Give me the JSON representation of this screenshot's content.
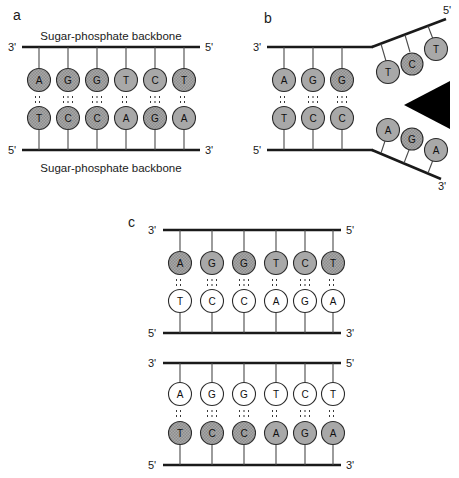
{
  "figure": {
    "panels": [
      {
        "id": "a",
        "label": "a",
        "top_strand": {
          "left_end": "3'",
          "right_end": "5'",
          "backbone_label": "Sugar-phosphate backbone",
          "bases": [
            "A",
            "G",
            "G",
            "T",
            "C",
            "T"
          ],
          "base_fill": "shaded"
        },
        "bottom_strand": {
          "left_end": "5'",
          "right_end": "3'",
          "backbone_label": "Sugar-phosphate backbone",
          "bases": [
            "T",
            "C",
            "C",
            "A",
            "G",
            "A"
          ],
          "base_fill": "shaded"
        },
        "hydrogen_bonds": [
          2,
          3,
          3,
          2,
          3,
          2
        ]
      },
      {
        "id": "b",
        "label": "b",
        "paired_region": {
          "top_bases": [
            "A",
            "G",
            "G"
          ],
          "bottom_bases": [
            "T",
            "C",
            "C"
          ],
          "hydrogen_bonds": [
            2,
            3,
            3
          ]
        },
        "top_strand": {
          "left_end": "3'",
          "fork_end": "5'",
          "unpaired_bases": [
            "T",
            "C",
            "T"
          ]
        },
        "bottom_strand": {
          "left_end": "5'",
          "fork_end": "3'",
          "unpaired_bases": [
            "A",
            "G",
            "A"
          ]
        },
        "fork_marker": "black-triangle"
      },
      {
        "id": "c",
        "label": "c",
        "duplexes": [
          {
            "top_strand": {
              "left_end": "3'",
              "right_end": "5'",
              "bases": [
                "A",
                "G",
                "G",
                "T",
                "C",
                "T"
              ],
              "base_fill": "shaded"
            },
            "bottom_strand": {
              "left_end": "5'",
              "right_end": "3'",
              "bases": [
                "T",
                "C",
                "C",
                "A",
                "G",
                "A"
              ],
              "base_fill": "white"
            },
            "hydrogen_bonds": [
              2,
              3,
              3,
              2,
              3,
              2
            ]
          },
          {
            "top_strand": {
              "left_end": "3'",
              "right_end": "5'",
              "bases": [
                "A",
                "G",
                "G",
                "T",
                "C",
                "T"
              ],
              "base_fill": "white"
            },
            "bottom_strand": {
              "left_end": "5'",
              "right_end": "3'",
              "bases": [
                "T",
                "C",
                "C",
                "A",
                "G",
                "A"
              ],
              "base_fill": "shaded"
            },
            "hydrogen_bonds": [
              2,
              3,
              3,
              2,
              3,
              2
            ]
          }
        ]
      }
    ],
    "colors": {
      "line": "#1a1a1a",
      "base_shaded": "#a8a8a8",
      "base_white": "#ffffff",
      "base_stroke": "#2b2b2b",
      "marker_black": "#000000",
      "background": "#ffffff"
    }
  }
}
